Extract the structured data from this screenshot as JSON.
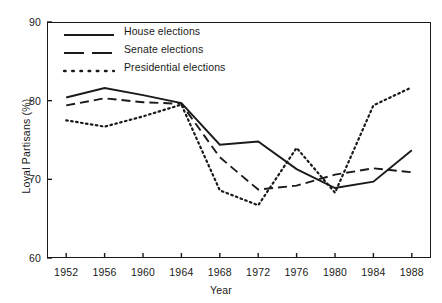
{
  "chart_data": {
    "type": "line",
    "title": "",
    "xlabel": "Year",
    "ylabel": "Loyal Partisans (%)",
    "xlim": [
      1950,
      1990
    ],
    "ylim": [
      60,
      90
    ],
    "x": [
      1952,
      1956,
      1960,
      1964,
      1968,
      1972,
      1976,
      1980,
      1984,
      1988
    ],
    "xticklabels": [
      "1952",
      "1956",
      "1960",
      "1964",
      "1968",
      "1972",
      "1976",
      "1980",
      "1984",
      "1988"
    ],
    "yticks": [
      60,
      70,
      80,
      90
    ],
    "yticklabels": [
      "60",
      "70",
      "80",
      "90"
    ],
    "grid": false,
    "legend_position": "upper left",
    "series": [
      {
        "name": "House elections",
        "style": "solid",
        "color": "#1a1a1a",
        "values": [
          80.4,
          81.6,
          80.7,
          79.7,
          74.4,
          74.8,
          71.3,
          68.9,
          69.7,
          73.7
        ]
      },
      {
        "name": "Senate elections",
        "style": "dashed",
        "color": "#1a1a1a",
        "values": [
          79.4,
          80.3,
          79.8,
          79.6,
          72.8,
          68.7,
          69.2,
          70.6,
          71.4,
          70.9
        ]
      },
      {
        "name": "Presidential elections",
        "style": "dotted",
        "color": "#1a1a1a",
        "values": [
          77.5,
          76.7,
          78.0,
          79.5,
          68.6,
          66.7,
          74.0,
          68.3,
          79.4,
          81.7
        ]
      }
    ]
  },
  "axis": {
    "ylabel": "Loyal Partisans (%)",
    "xlabel": "Year"
  }
}
